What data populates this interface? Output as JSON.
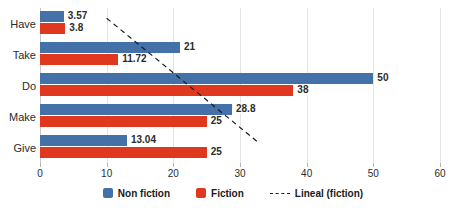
{
  "chart_data": {
    "type": "bar",
    "orientation": "horizontal",
    "title": "",
    "xlabel": "",
    "ylabel": "",
    "xlim": [
      0,
      60
    ],
    "xticks": [
      0,
      10,
      20,
      30,
      40,
      50,
      60
    ],
    "xtick_labels": [
      "0",
      "10",
      "20",
      "30",
      "40",
      "50",
      "60"
    ],
    "grid": true,
    "grid_axis": "x",
    "legend_position": "bottom-center",
    "categories": [
      "Have",
      "Take",
      "Do",
      "Make",
      "Give"
    ],
    "series": [
      {
        "name": "Non fiction",
        "color": "#4472a8",
        "values": [
          3.57,
          21,
          50,
          28.8,
          13.04
        ],
        "data_labels": [
          "3.57",
          "21",
          "50",
          "28.8",
          "13.04"
        ]
      },
      {
        "name": "Fiction",
        "color": "#e0381f",
        "values": [
          3.8,
          11.72,
          38,
          25,
          25
        ],
        "data_labels": [
          "3.8",
          "11.72",
          "38",
          "25",
          "25"
        ]
      }
    ],
    "trendline": {
      "name": "Lineal (fiction)",
      "style": "dashed",
      "color": "#1a1a1a",
      "start": {
        "x": 10.0,
        "category_index": 0
      },
      "end": {
        "x": 32.7,
        "category_index": 4
      }
    },
    "legend": [
      {
        "label": "Non fiction",
        "marker": "square",
        "color": "#4472a8"
      },
      {
        "label": "Fiction",
        "marker": "square",
        "color": "#e0381f"
      },
      {
        "label": "Lineal (fiction)",
        "marker": "dashed-line",
        "color": "#1a1a1a"
      }
    ]
  },
  "colors": {
    "nonfiction": "#4472a8",
    "fiction": "#e0381f",
    "trendline": "#1a1a1a",
    "gridline": "#e3e3e3",
    "axis": "#c9c9c9",
    "text": "#2b2b2b",
    "background": "#ffffff"
  }
}
